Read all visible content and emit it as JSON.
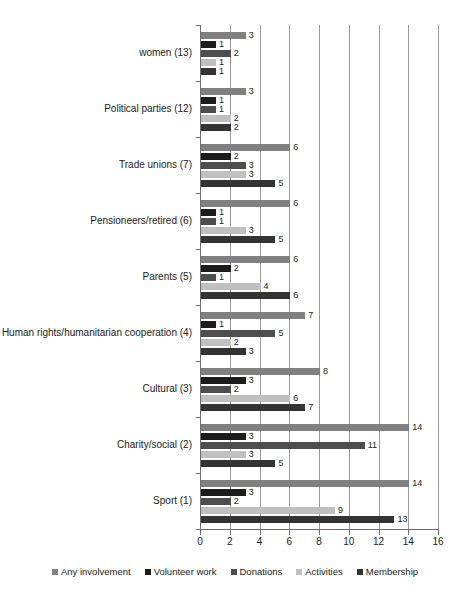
{
  "chart_data": {
    "type": "bar",
    "orientation": "horizontal",
    "title": "",
    "xlabel": "",
    "ylabel": "",
    "xlim": [
      0,
      16
    ],
    "xticks": [
      0,
      2,
      4,
      6,
      8,
      10,
      12,
      14,
      16
    ],
    "grid": true,
    "legend_position": "bottom",
    "categories": [
      "Sport (1)",
      "Charity/social (2)",
      "Cultural (3)",
      "Human rights/humanitarian cooperation (4)",
      "Parents (5)",
      "Pensioneers/retired (6)",
      "Trade unions (7)",
      "Political parties (12)",
      "women (13)"
    ],
    "series": [
      {
        "name": "Any involvement",
        "color": "#808080",
        "values": [
          14,
          14,
          8,
          7,
          6,
          6,
          6,
          3,
          3
        ]
      },
      {
        "name": "Volunteer work",
        "color": "#1c1c1c",
        "values": [
          3,
          3,
          3,
          1,
          2,
          1,
          2,
          1,
          1
        ]
      },
      {
        "name": "Donations",
        "color": "#4d4d4d",
        "values": [
          2,
          11,
          2,
          5,
          1,
          1,
          3,
          1,
          2
        ]
      },
      {
        "name": "Activities",
        "color": "#c0c0c0",
        "values": [
          9,
          3,
          6,
          2,
          4,
          3,
          3,
          2,
          1
        ]
      },
      {
        "name": "Membership",
        "color": "#333333",
        "values": [
          13,
          5,
          7,
          3,
          6,
          5,
          5,
          2,
          1
        ]
      }
    ]
  }
}
